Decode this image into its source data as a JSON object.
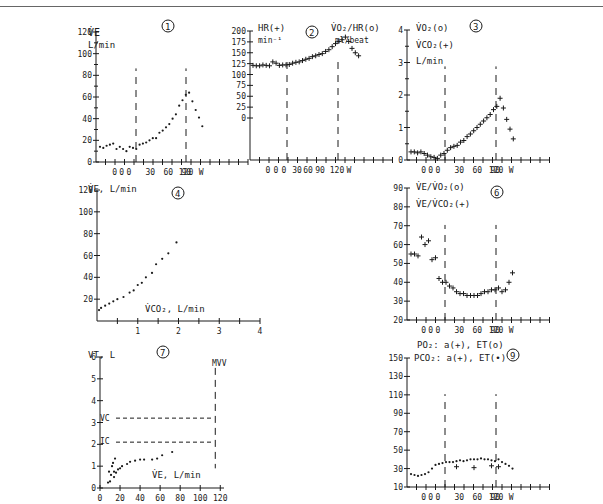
{
  "header": {
    "caption": "... oxygen ... ting"
  },
  "chart_data": [
    {
      "panel": "1",
      "type": "scatter",
      "ylabel": "V̇E L/min",
      "xlabel": "W",
      "yticks": [
        0,
        20,
        40,
        60,
        80,
        100,
        120
      ],
      "xticks": [
        "0",
        "0",
        "0",
        "30",
        "60",
        "90",
        "120"
      ],
      "markers": [
        "rest_end",
        "max_work"
      ],
      "series": [
        {
          "name": "VE",
          "marker": "dot",
          "values": [
            14,
            13,
            15,
            16,
            17,
            12,
            14,
            12,
            10,
            14,
            13,
            12,
            16,
            17,
            18,
            20,
            22,
            22,
            27,
            29,
            32,
            35,
            40,
            44,
            52,
            57,
            62,
            64,
            56,
            48,
            41,
            33
          ]
        }
      ]
    },
    {
      "panel": "2",
      "type": "scatter",
      "ylabel": "HR(+) min-1",
      "ylabel2": "V̇O2/HR(o) ml/beat",
      "xlabel": "W",
      "yticks": [
        0,
        25,
        50,
        75,
        100,
        125,
        150,
        175,
        200
      ],
      "xticks": [
        "0",
        "0",
        "0",
        "30",
        "60",
        "90",
        "120"
      ],
      "series": [
        {
          "name": "HR",
          "marker": "plus",
          "values": [
            121,
            120,
            120,
            122,
            121,
            120,
            129,
            126,
            121,
            122,
            122,
            123,
            126,
            128,
            129,
            132,
            135,
            137,
            141,
            143,
            146,
            148,
            153,
            157,
            164,
            171,
            176,
            180,
            186,
            176,
            160,
            150,
            143
          ]
        }
      ]
    },
    {
      "panel": "3",
      "type": "scatter",
      "ylabel": "V̇O2(o) V̇CO2(+) L/min",
      "xlabel": "W",
      "yticks": [
        0,
        1,
        2,
        3,
        4
      ],
      "xticks": [
        "0",
        "0",
        "0",
        "30",
        "60",
        "90",
        "120"
      ],
      "series": [
        {
          "name": "VCO2",
          "marker": "plus",
          "values": [
            0.25,
            0.25,
            0.22,
            0.25,
            0.2,
            0.15,
            0.1,
            0.08,
            0.05,
            0.15,
            0.2,
            0.3,
            0.38,
            0.42,
            0.45,
            0.55,
            0.6,
            0.72,
            0.8,
            0.9,
            1.0,
            1.1,
            1.2,
            1.3,
            1.4,
            1.55,
            1.65,
            1.9,
            1.6,
            1.25,
            0.95,
            0.65
          ]
        }
      ]
    },
    {
      "panel": "4",
      "type": "scatter",
      "ylabel": "V̇E, L/min",
      "xlabel": "V̇CO2, L/min",
      "yticks": [
        20,
        40,
        60,
        80,
        100,
        120
      ],
      "xticks": [
        1,
        2,
        3,
        4
      ],
      "series": [
        {
          "name": "VE vs VCO2",
          "marker": "dot",
          "points": [
            [
              0.05,
              10
            ],
            [
              0.1,
              12
            ],
            [
              0.2,
              14
            ],
            [
              0.3,
              16
            ],
            [
              0.4,
              18
            ],
            [
              0.5,
              20
            ],
            [
              0.65,
              22
            ],
            [
              0.8,
              26
            ],
            [
              0.9,
              28
            ],
            [
              1.0,
              33
            ],
            [
              1.1,
              35
            ],
            [
              1.2,
              40
            ],
            [
              1.35,
              44
            ],
            [
              1.45,
              52
            ],
            [
              1.6,
              57
            ],
            [
              1.75,
              62
            ],
            [
              1.95,
              72
            ]
          ]
        }
      ]
    },
    {
      "panel": "6",
      "type": "scatter",
      "ylabel": "V̇E/V̇O2(o) V̇E/V̇CO2(+)",
      "xlabel": "W",
      "yticks": [
        20,
        30,
        40,
        50,
        60,
        70,
        80,
        90
      ],
      "xticks": [
        "0",
        "0",
        "0",
        "30",
        "60",
        "90",
        "120"
      ],
      "series": [
        {
          "name": "VE/VCO2",
          "marker": "plus",
          "values": [
            55,
            55,
            54,
            64,
            60,
            62,
            52,
            53,
            42,
            40,
            40,
            38,
            37,
            35,
            34,
            34,
            33,
            33,
            33,
            33,
            34,
            35,
            35,
            36,
            36,
            37,
            35,
            36,
            40,
            45
          ]
        }
      ]
    },
    {
      "panel": "7",
      "type": "scatter",
      "ylabel": "VT, L",
      "xlabel": "V̇E, L/min",
      "yticks": [
        0,
        1,
        2,
        3,
        4,
        5,
        6
      ],
      "xticks": [
        0,
        20,
        40,
        60,
        80,
        100,
        120
      ],
      "reference_lines": [
        {
          "label": "VC",
          "y": 3.2
        },
        {
          "label": "IC",
          "y": 2.1
        },
        {
          "label": "MVV",
          "x": 115
        }
      ],
      "series": [
        {
          "name": "VT vs VE",
          "marker": "dot",
          "points": [
            [
              8,
              0.25
            ],
            [
              10,
              0.3
            ],
            [
              9,
              0.75
            ],
            [
              11,
              0.6
            ],
            [
              12,
              1.0
            ],
            [
              13,
              1.15
            ],
            [
              14,
              0.5
            ],
            [
              15,
              1.35
            ],
            [
              14,
              0.75
            ],
            [
              16,
              0.7
            ],
            [
              18,
              0.85
            ],
            [
              20,
              0.9
            ],
            [
              22,
              1.0
            ],
            [
              27,
              1.1
            ],
            [
              30,
              1.2
            ],
            [
              35,
              1.25
            ],
            [
              40,
              1.3
            ],
            [
              44,
              1.3
            ],
            [
              52,
              1.3
            ],
            [
              57,
              1.35
            ],
            [
              62,
              1.5
            ],
            [
              72,
              1.65
            ]
          ]
        }
      ]
    },
    {
      "panel": "9",
      "type": "scatter",
      "ylabel": "PO2: a(+), ET(o)",
      "ylabel2": "PCO2: a(+), ET(•)",
      "xlabel": "W",
      "yticks": [
        10,
        30,
        50,
        70,
        90,
        110,
        130,
        150
      ],
      "xticks": [
        "0",
        "0",
        "0",
        "30",
        "60",
        "90",
        "120"
      ],
      "series": [
        {
          "name": "PETCO2",
          "marker": "dot",
          "values": [
            24,
            23,
            22,
            23,
            24,
            26,
            30,
            34,
            35,
            36,
            37,
            37,
            37,
            38,
            39,
            38,
            39,
            40,
            40,
            40,
            41,
            40,
            40,
            39,
            38,
            40,
            37,
            35,
            33,
            30
          ]
        },
        {
          "name": "PaCO2",
          "marker": "plus",
          "values_at": [
            [
              13,
              32
            ],
            [
              18,
              31
            ],
            [
              23,
              33
            ],
            [
              25,
              32
            ]
          ]
        }
      ]
    }
  ],
  "panels": {
    "p1": {
      "num": "1",
      "title": "V̇E",
      "unit": "L/min",
      "y": [
        "120",
        "100",
        "80",
        "60",
        "40",
        "20",
        "0"
      ],
      "x": [
        "0",
        "0",
        "0",
        "30",
        "60",
        "90",
        "120",
        "W"
      ]
    },
    "p2": {
      "num": "2",
      "title": "HR(+)",
      "unit": "min⁻¹",
      "title2": "V̇O₂/HR(o)",
      "unit2": "ml/beat",
      "y": [
        "200",
        "175",
        "150",
        "125",
        "100",
        "75",
        "50",
        "25",
        "0"
      ],
      "x": [
        "0",
        "0",
        "0",
        "30",
        "60",
        "90",
        "120",
        "W"
      ]
    },
    "p3": {
      "num": "3",
      "t1": "V̇O₂(o)",
      "t2": "V̇CO₂(+)",
      "t3": "L/min",
      "y": [
        "4",
        "3",
        "2",
        "1",
        "0"
      ],
      "x": [
        "0",
        "0",
        "0",
        "30",
        "60",
        "90",
        "120",
        "W"
      ]
    },
    "p4": {
      "num": "4",
      "title": "V̇E, L/min",
      "xtitle": "V̇CO₂, L/min",
      "y": [
        "120",
        "100",
        "80",
        "60",
        "40",
        "20"
      ],
      "x": [
        "1",
        "2",
        "3",
        "4"
      ]
    },
    "p6": {
      "num": "6",
      "t1": "V̇E/V̇O₂(o)",
      "t2": "V̇E/V̇CO₂(+)",
      "y": [
        "90",
        "80",
        "70",
        "60",
        "50",
        "40",
        "30",
        "20"
      ],
      "x": [
        "0",
        "0",
        "0",
        "30",
        "60",
        "90",
        "120",
        "W"
      ]
    },
    "p7": {
      "num": "7",
      "title": "VT, L",
      "xtitle": "V̇E, L/min",
      "vc": "VC",
      "ic": "IC",
      "mvv": "MVV",
      "y": [
        "6",
        "5",
        "4",
        "3",
        "2",
        "1",
        "0"
      ],
      "x": [
        "0",
        "20",
        "40",
        "60",
        "80",
        "100",
        "120"
      ]
    },
    "p9": {
      "num": "9",
      "t1": "PO₂: a(+), ET(o)",
      "t2": "PCO₂: a(+), ET(•)",
      "y": [
        "150",
        "130",
        "110",
        "90",
        "70",
        "50",
        "30",
        "10"
      ],
      "x": [
        "0",
        "0",
        "0",
        "30",
        "60",
        "90",
        "120",
        "W"
      ]
    }
  }
}
